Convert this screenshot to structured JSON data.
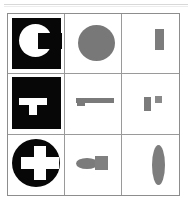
{
  "figure": {
    "rows": 3,
    "columns": 3,
    "background_color": "#ffffff",
    "grid_border_color": "#8d8d8d",
    "grid_line_color": "#9a9a9a",
    "black_fill": "#070707",
    "white_fill": "#ffffff",
    "gray_fill": "#7a7a7a"
  },
  "top_rule": {
    "primary_color": "#d8d8d8",
    "secondary_color": "#ececec"
  },
  "cells": [
    {
      "row": 1,
      "column": 1,
      "name": "c-shape-on-black-tile",
      "background": "black-tile",
      "shape": "letter-c",
      "shape_color": "#ffffff",
      "tile_color": "#070707"
    },
    {
      "row": 1,
      "column": 2,
      "name": "filled-circle",
      "background": "white",
      "shape": "circle",
      "shape_color": "#787878"
    },
    {
      "row": 1,
      "column": 3,
      "name": "small-vertical-rectangle",
      "background": "white",
      "shape": "rectangle",
      "shape_color": "#7c7c7c"
    },
    {
      "row": 2,
      "column": 1,
      "name": "t-shape-on-black-tile",
      "background": "black-tile",
      "shape": "letter-t",
      "shape_color": "#ffffff",
      "tile_color": "#070707"
    },
    {
      "row": 2,
      "column": 2,
      "name": "horizontal-bar-with-tab",
      "background": "white",
      "shape": "bar-with-tab",
      "shape_color": "#7a7a7a"
    },
    {
      "row": 2,
      "column": 3,
      "name": "two-small-rectangles",
      "background": "white",
      "shape": "rectangle-pair",
      "shape_color": "#7b7b7b"
    },
    {
      "row": 3,
      "column": 1,
      "name": "cross-on-black-disc",
      "background": "black-disc",
      "shape": "plus-cross",
      "shape_color": "#ffffff",
      "tile_color": "#070707"
    },
    {
      "row": 3,
      "column": 2,
      "name": "ellipse-with-square",
      "background": "white",
      "shape": "ellipse-plus-square",
      "shape_color": "#7b7b7b"
    },
    {
      "row": 3,
      "column": 3,
      "name": "tall-narrow-ellipse",
      "background": "white",
      "shape": "ellipse",
      "shape_color": "#7d7d7d"
    }
  ]
}
